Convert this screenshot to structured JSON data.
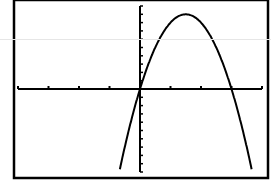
{
  "chart_data": {
    "type": "line",
    "title": "",
    "xlabel": "",
    "ylabel": "",
    "function": "y = -4x^2 + 12x",
    "xlim": [
      -4,
      4
    ],
    "ylim": [
      -10,
      10
    ],
    "x_scale": 1,
    "y_scale": 1,
    "grid": false,
    "legend": null,
    "x_axis_ticks": [
      -4,
      -3,
      -2,
      -1,
      0,
      1,
      2,
      3,
      4
    ],
    "series": [
      {
        "name": "parabola",
        "x": [
          -0.68,
          -0.5,
          0,
          0.5,
          1,
          1.5,
          2,
          2.5,
          3,
          3.5,
          3.65
        ],
        "y": [
          -10,
          -7,
          0,
          5,
          8,
          9,
          8,
          5,
          0,
          -7,
          -10
        ]
      }
    ],
    "annotations": {
      "vertex": [
        1.5,
        9
      ],
      "roots": [
        0,
        3
      ]
    }
  },
  "colors": {
    "background": "#ffffff",
    "ink": "#000000"
  }
}
